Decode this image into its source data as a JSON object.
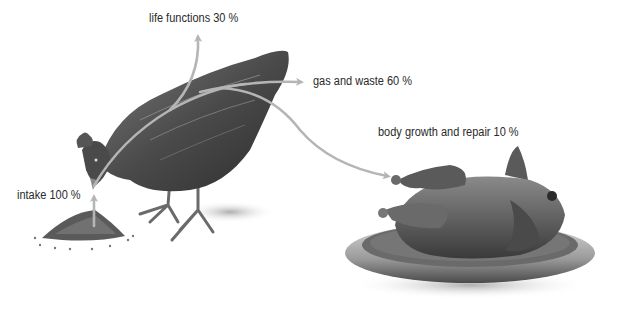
{
  "diagram": {
    "colors": {
      "arrow": "#b5b5b5",
      "label_text": "#2a2a2a",
      "background": "#ffffff"
    },
    "labels": {
      "intake": "intake 100 %",
      "life_functions": "life functions 30 %",
      "gas_waste": "gas and waste 60 %",
      "growth_repair": "body growth and repair 10 %"
    },
    "flows": [
      {
        "name": "intake",
        "percent": 100
      },
      {
        "name": "life functions",
        "percent": 30
      },
      {
        "name": "gas and waste",
        "percent": 60
      },
      {
        "name": "body growth and repair",
        "percent": 10
      }
    ],
    "illustrations": [
      "feed-pile",
      "live-chicken",
      "roast-chicken-on-platter"
    ]
  }
}
